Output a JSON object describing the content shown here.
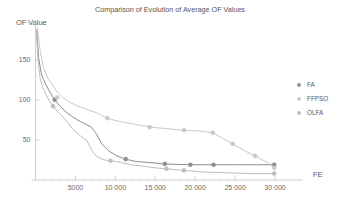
{
  "chart_data": {
    "type": "line",
    "title": "Comparison of Evolution of Average OF Values",
    "xlabel": "FE",
    "ylabel": "OF Value",
    "xlim": [
      0,
      31000
    ],
    "ylim": [
      0,
      192
    ],
    "grid": false,
    "legend_position": "right",
    "xticks": [
      5000,
      10000,
      15000,
      20000,
      25000,
      30000
    ],
    "xticklabels": [
      "5000",
      "10 000",
      "15 000",
      "20 000",
      "25 000",
      "30 000"
    ],
    "yticks": [
      50,
      100,
      150
    ],
    "yticklabels": [
      "50",
      "100",
      "150"
    ],
    "series": [
      {
        "name": "FA",
        "color": "#8d8d8d",
        "marker": "circle",
        "x": [
          150,
          400,
          700,
          1000,
          1400,
          1900,
          2400,
          3000,
          3800,
          4600,
          5600,
          6400,
          7000,
          7600,
          8300,
          9200,
          10200,
          11300,
          12600,
          14000,
          16200,
          19400,
          22300,
          25500,
          27800,
          29900
        ],
        "y": [
          187,
          152,
          134,
          125,
          117,
          108,
          100,
          93,
          85,
          79,
          73,
          69,
          66,
          58,
          45,
          36,
          30,
          26,
          23,
          22,
          20,
          19,
          19,
          19,
          19,
          19
        ],
        "markers_x": [
          2400,
          11300,
          16200,
          19400,
          22300,
          29900
        ],
        "markers_y": [
          100,
          26,
          20,
          19,
          19,
          19
        ]
      },
      {
        "name": "FFPSO",
        "color": "#c9c9c9",
        "marker": "circle",
        "x": [
          250,
          600,
          1000,
          1500,
          2100,
          2700,
          3400,
          4300,
          5300,
          6400,
          7600,
          9000,
          10500,
          12200,
          14300,
          16400,
          18600,
          20600,
          22200,
          23400,
          24700,
          26100,
          27500,
          29000,
          29900
        ],
        "y": [
          190,
          160,
          140,
          127,
          119,
          110,
          103,
          97,
          92,
          88,
          84,
          77,
          73,
          70,
          66,
          64,
          62,
          61,
          59,
          52,
          45,
          37,
          30,
          22,
          15
        ],
        "markers_x": [
          2700,
          9000,
          14300,
          18600,
          22200,
          24700,
          27500,
          29900
        ],
        "markers_y": [
          103,
          77,
          66,
          62,
          59,
          45,
          30,
          15
        ]
      },
      {
        "name": "OLFA",
        "color": "#bdbdbd",
        "marker": "circle",
        "x": [
          120,
          350,
          600,
          900,
          1300,
          1700,
          2200,
          2700,
          3300,
          4000,
          4800,
          5500,
          6000,
          6400,
          6800,
          7300,
          7900,
          8600,
          9400,
          10600,
          12000,
          13600,
          15200,
          16400,
          18600,
          21000,
          24000,
          27000,
          29900
        ],
        "y": [
          184,
          146,
          126,
          115,
          107,
          99,
          92,
          86,
          80,
          72,
          62,
          56,
          52,
          50,
          42,
          33,
          28,
          25,
          24,
          22,
          19,
          17,
          15,
          14,
          12,
          10,
          9,
          8,
          8
        ],
        "markers_x": [
          2200,
          9400,
          16400,
          18600,
          29900
        ],
        "markers_y": [
          92,
          24,
          14,
          12,
          8
        ]
      }
    ]
  },
  "legend": {
    "items": [
      {
        "label": "FA",
        "color": "#8d8d8d"
      },
      {
        "label": "FFPSO",
        "color": "#c9c9c9"
      },
      {
        "label": "OLFA",
        "color": "#bdbdbd"
      }
    ]
  }
}
